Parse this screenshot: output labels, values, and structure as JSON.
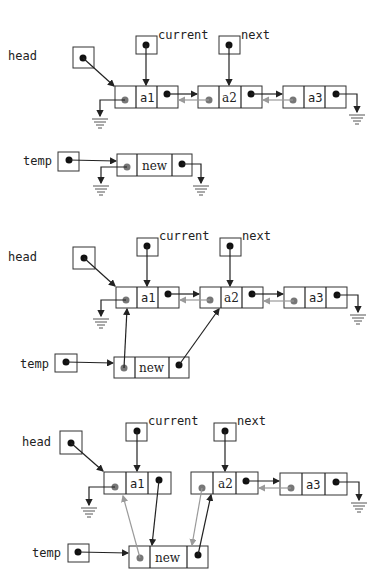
{
  "diagram": {
    "colors": {
      "line": "#222222",
      "prev_link": "#9a9a9a",
      "prev_dot": "#777777",
      "pointer_dot": "#111111"
    },
    "panels": [
      {
        "step": 1,
        "labels": {
          "head": "head",
          "current": "current",
          "next": "next",
          "temp": "temp"
        },
        "nodes": [
          {
            "id": "a1",
            "value": "a1"
          },
          {
            "id": "a2",
            "value": "a2"
          },
          {
            "id": "a3",
            "value": "a3"
          },
          {
            "id": "new",
            "value": "new"
          }
        ],
        "links": [
          "head -> a1",
          "current -> a1",
          "next -> a2",
          "a1.next -> a2",
          "a2.prev -> a1",
          "a2.next -> a3",
          "a3.prev -> a2",
          "a1.prev -> null",
          "a3.next -> null",
          "temp -> new",
          "new.prev -> null",
          "new.next -> null"
        ]
      },
      {
        "step": 2,
        "labels": {
          "head": "head",
          "current": "current",
          "next": "next",
          "temp": "temp"
        },
        "nodes": [
          {
            "id": "a1",
            "value": "a1"
          },
          {
            "id": "a2",
            "value": "a2"
          },
          {
            "id": "a3",
            "value": "a3"
          },
          {
            "id": "new",
            "value": "new"
          }
        ],
        "links": [
          "head -> a1",
          "current -> a1",
          "next -> a2",
          "a1.next -> a2",
          "a2.prev -> a1",
          "a2.next -> a3",
          "a3.prev -> a2",
          "a1.prev -> null",
          "a3.next -> null",
          "temp -> new",
          "new.prev -> a1",
          "new.next -> a2"
        ]
      },
      {
        "step": 3,
        "labels": {
          "head": "head",
          "current": "current",
          "next": "next",
          "temp": "temp"
        },
        "nodes": [
          {
            "id": "a1",
            "value": "a1"
          },
          {
            "id": "a2",
            "value": "a2"
          },
          {
            "id": "a3",
            "value": "a3"
          },
          {
            "id": "new",
            "value": "new"
          }
        ],
        "links": [
          "head -> a1",
          "current -> a1",
          "next -> a2",
          "a1.next -> new",
          "new.prev -> a1",
          "new.next -> a2",
          "a2.prev -> new",
          "a2.next -> a3",
          "a3.prev -> a2",
          "a1.prev -> null",
          "a3.next -> null",
          "temp -> new"
        ]
      }
    ]
  }
}
